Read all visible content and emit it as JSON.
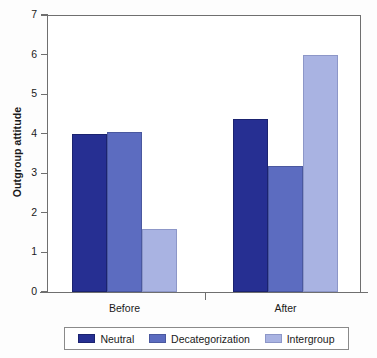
{
  "chart_data": {
    "type": "bar",
    "title": "",
    "subtitle": "",
    "xlabel": "",
    "ylabel": "Outgroup attitude",
    "categories": [
      "Before",
      "After"
    ],
    "series": [
      {
        "name": "Neutral",
        "color": "#262f92",
        "values": [
          4.0,
          4.37
        ]
      },
      {
        "name": "Decategorization",
        "color": "#5c6cc0",
        "values": [
          4.05,
          3.18
        ]
      },
      {
        "name": "Intergroup",
        "color": "#a9b3e2",
        "values": [
          1.6,
          6.0
        ]
      }
    ],
    "ylim": [
      0,
      7
    ],
    "ytick_labels": [
      "0",
      "1",
      "2",
      "3",
      "4",
      "5",
      "6",
      "7"
    ],
    "ytick_values": [
      0,
      1,
      2,
      3,
      4,
      5,
      6,
      7
    ],
    "grid": false,
    "legend_position": "bottom"
  },
  "axis": {
    "y_title": "Outgroup attitude"
  },
  "legend": {
    "items": [
      {
        "label": "Neutral"
      },
      {
        "label": "Decategorization"
      },
      {
        "label": "Intergroup"
      }
    ]
  }
}
